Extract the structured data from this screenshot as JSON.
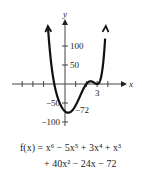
{
  "chart_data": {
    "type": "line",
    "title": "",
    "xlabel": "x",
    "ylabel": "y",
    "function": "f(x) = x^6 - 5x^5 + 3x^4 + x^3 + 40x^2 - 24x - 72",
    "xlim": [
      -5,
      5
    ],
    "ylim": [
      -110,
      160
    ],
    "x_ticks": [
      -4,
      -3,
      -2,
      -1,
      1,
      2,
      3,
      4
    ],
    "x_tick_labels": [
      {
        "value": 3,
        "label": "3"
      }
    ],
    "y_ticks": [
      100,
      50,
      -50,
      -100
    ],
    "y_tick_labels": [
      {
        "value": 100,
        "label": "100"
      },
      {
        "value": 50,
        "label": "50"
      },
      {
        "value": -50,
        "label": "-50"
      },
      {
        "value": -100,
        "label": "-100"
      }
    ],
    "annotations": [
      {
        "x": 0,
        "y": -72,
        "label": "-72"
      }
    ],
    "series": [
      {
        "name": "f(x)",
        "x_range": [
          -1.6,
          3.75
        ]
      }
    ],
    "grid": false,
    "legend": "none"
  },
  "caption": {
    "line1_prefix": "f(x) = x",
    "line2": "+ 40x² − 24x − 72",
    "line1": "f(x) = x⁶ − 5x⁵ + 3x⁴ + x³"
  }
}
